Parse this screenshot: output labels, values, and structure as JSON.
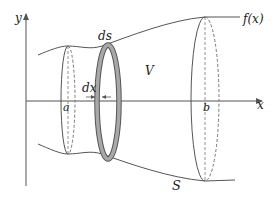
{
  "diagram": {
    "labels": {
      "y_axis": "y",
      "x_axis": "x",
      "function": "f(x)",
      "arc_element": "ds",
      "width_element": "dx",
      "volume": "V",
      "surface": "S",
      "lower_bound": "a",
      "upper_bound": "b"
    },
    "colors": {
      "line": "#555555",
      "ring_fill": "#a8a8a8",
      "ring_stroke": "#555555",
      "text": "#222222"
    }
  }
}
